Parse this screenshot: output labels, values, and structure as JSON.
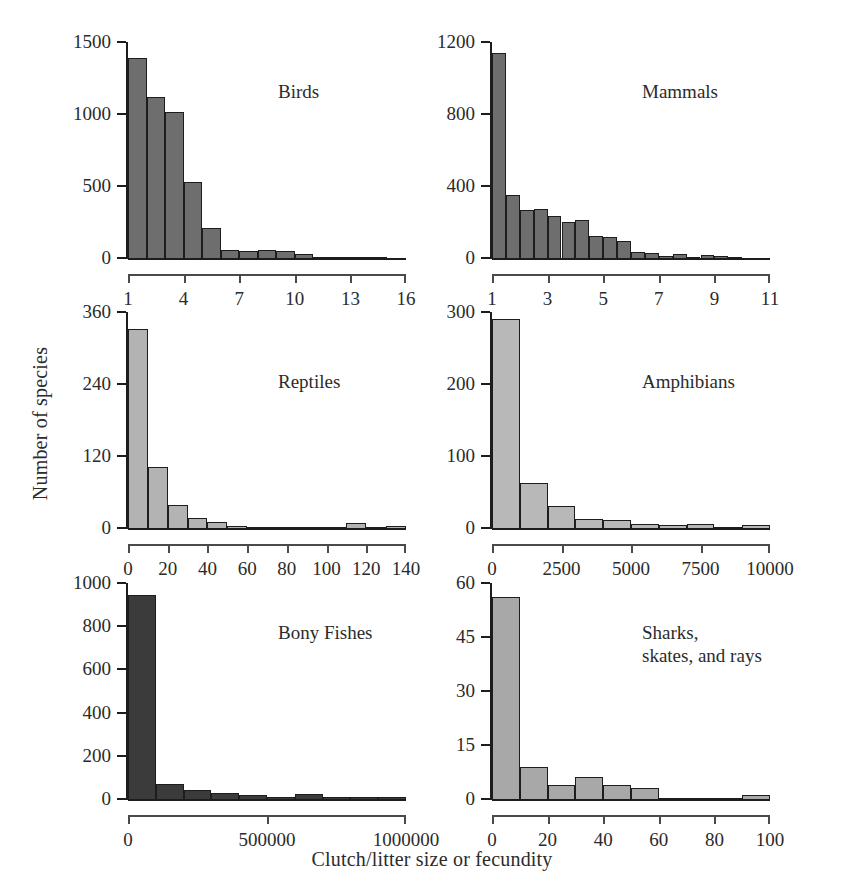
{
  "chart_data": {
    "type": "bar",
    "title": "",
    "xlabel": "Clutch/litter size or fecundity",
    "ylabel": "Number of species",
    "grid": false,
    "legend": "none",
    "layout": "2 columns x 3 rows of histogram panels",
    "panels": [
      {
        "title": "Birds",
        "color": "#6e6e6e",
        "xlim": [
          1,
          16
        ],
        "ylim": [
          0,
          1500
        ],
        "xticks": [
          1,
          4,
          7,
          10,
          13,
          16
        ],
        "xticklabels": [
          "1",
          "4",
          "7",
          "10",
          "13",
          "16"
        ],
        "yticks": [
          0,
          500,
          1000,
          1500
        ],
        "yticklabels": [
          "0",
          "500",
          "1000",
          "1500"
        ],
        "bin_width": 1,
        "bin_starts": [
          1,
          2,
          3,
          4,
          5,
          6,
          7,
          8,
          9,
          10,
          11,
          12,
          13,
          14
        ],
        "values": [
          1390,
          1115,
          1015,
          525,
          205,
          55,
          48,
          55,
          48,
          30,
          10,
          3,
          2,
          2
        ]
      },
      {
        "title": "Mammals",
        "color": "#6e6e6e",
        "xlim": [
          1,
          11
        ],
        "ylim": [
          0,
          1200
        ],
        "xticks": [
          1,
          3,
          5,
          7,
          9,
          11
        ],
        "xticklabels": [
          "1",
          "3",
          "5",
          "7",
          "9",
          "11"
        ],
        "yticks": [
          0,
          400,
          800,
          1200
        ],
        "yticklabels": [
          "0",
          "400",
          "800",
          "1200"
        ],
        "bin_width": 0.5,
        "bin_starts": [
          1,
          1.5,
          2,
          2.5,
          3,
          3.5,
          4,
          4.5,
          5,
          5.5,
          6,
          6.5,
          7,
          7.5,
          8,
          8.5,
          9,
          9.5
        ],
        "values": [
          1140,
          350,
          265,
          275,
          235,
          200,
          210,
          120,
          115,
          95,
          35,
          28,
          12,
          22,
          8,
          16,
          10,
          3
        ]
      },
      {
        "title": "Reptiles",
        "color": "#b3b3b3",
        "xlim": [
          0,
          140
        ],
        "ylim": [
          0,
          360
        ],
        "xticks": [
          0,
          20,
          40,
          60,
          80,
          100,
          120,
          140
        ],
        "xticklabels": [
          "0",
          "20",
          "40",
          "60",
          "80",
          "100",
          "120",
          "140"
        ],
        "yticks": [
          0,
          120,
          240,
          360
        ],
        "yticklabels": [
          "0",
          "120",
          "240",
          "360"
        ],
        "bin_width": 10,
        "bin_starts": [
          0,
          10,
          20,
          30,
          40,
          50,
          60,
          70,
          80,
          90,
          100,
          110,
          120,
          130
        ],
        "values": [
          332,
          102,
          38,
          16,
          10,
          3,
          1,
          1,
          2,
          2,
          2,
          8,
          2,
          3
        ]
      },
      {
        "title": "Amphibians",
        "color": "#b8b8b8",
        "xlim": [
          0,
          10000
        ],
        "ylim": [
          0,
          300
        ],
        "xticks": [
          0,
          2500,
          5000,
          7500,
          10000
        ],
        "xticklabels": [
          "0",
          "2500",
          "5000",
          "7500",
          "10000"
        ],
        "yticks": [
          0,
          100,
          200,
          300
        ],
        "yticklabels": [
          "0",
          "100",
          "200",
          "300"
        ],
        "bin_width": 1000,
        "bin_starts": [
          0,
          1000,
          2000,
          3000,
          4000,
          5000,
          6000,
          7000,
          8000,
          9000
        ],
        "values": [
          290,
          62,
          30,
          13,
          11,
          5,
          4,
          6,
          2,
          4
        ]
      },
      {
        "title": "Bony Fishes",
        "color": "#3b3b3b",
        "xlim": [
          0,
          1000000
        ],
        "ylim": [
          0,
          1000
        ],
        "xticks": [
          0,
          500000,
          1000000
        ],
        "xticklabels": [
          "0",
          "500000",
          "1000000"
        ],
        "yticks": [
          0,
          200,
          400,
          600,
          800,
          1000
        ],
        "yticklabels": [
          "0",
          "200",
          "400",
          "600",
          "800",
          "1000"
        ],
        "bin_width": 100000,
        "bin_starts": [
          0,
          100000,
          200000,
          300000,
          400000,
          500000,
          600000,
          700000,
          800000,
          900000
        ],
        "values": [
          945,
          68,
          44,
          30,
          20,
          8,
          22,
          10,
          8,
          8
        ]
      },
      {
        "title": "Sharks,\nskates, and rays",
        "color": "#a8a8a8",
        "xlim": [
          0,
          100
        ],
        "ylim": [
          0,
          60
        ],
        "xticks": [
          0,
          20,
          40,
          60,
          80,
          100
        ],
        "xticklabels": [
          "0",
          "20",
          "40",
          "60",
          "80",
          "100"
        ],
        "yticks": [
          0,
          15,
          30,
          45,
          60
        ],
        "yticklabels": [
          "0",
          "15",
          "30",
          "45",
          "60"
        ],
        "bin_width": 10,
        "bin_starts": [
          0,
          10,
          20,
          30,
          40,
          50,
          60,
          70,
          80,
          90
        ],
        "values": [
          56,
          9,
          4,
          6,
          4,
          3,
          0,
          0,
          0,
          1
        ]
      }
    ]
  },
  "figure": {
    "xlabel": "Clutch/litter size or fecundity",
    "ylabel": "Number of species"
  }
}
